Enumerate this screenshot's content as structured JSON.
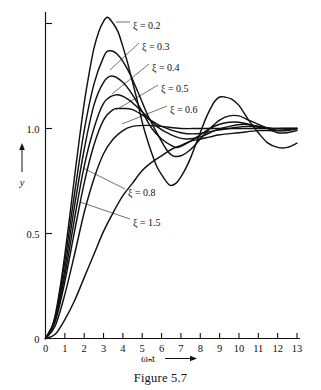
{
  "figure": {
    "caption": "Figure 5.7"
  },
  "chart_data": {
    "type": "line",
    "title": "",
    "subtitle": "",
    "xlabel": "ωₙt",
    "ylabel": "y",
    "xlim": [
      0,
      13
    ],
    "ylim": [
      0,
      1.6
    ],
    "grid": false,
    "legend_position": "inline-annotations",
    "x_ticks": [
      "0",
      "1",
      "2",
      "3",
      "4",
      "5",
      "6",
      "7",
      "8",
      "9",
      "10",
      "11",
      "12",
      "13"
    ],
    "x_tick_values": [
      0,
      1,
      2,
      3,
      4,
      5,
      6,
      7,
      8,
      9,
      10,
      11,
      12,
      13
    ],
    "y_ticks": [
      "0",
      "0.5",
      "1.0",
      ""
    ],
    "y_tick_values": [
      0,
      0.5,
      1.0,
      1.5
    ],
    "series": [
      {
        "name": "ξ = 0.2",
        "label": "ξ = 0.2",
        "zeta": 0.2,
        "peak_value": 1.53,
        "peak_time": 3.21,
        "trough_value": 0.73,
        "trough_time": 6.42,
        "second_peak_value": 1.14,
        "second_peak_time": 9.62,
        "x": [
          0,
          0.25,
          0.5,
          0.75,
          1,
          1.25,
          1.5,
          1.75,
          2,
          2.25,
          2.5,
          2.75,
          3,
          3.21,
          3.5,
          3.75,
          4,
          4.25,
          4.5,
          4.75,
          5,
          5.25,
          5.5,
          5.75,
          6,
          6.42,
          6.75,
          7,
          7.25,
          7.5,
          7.75,
          8,
          8.25,
          8.5,
          8.75,
          9,
          9.25,
          9.62,
          10,
          10.5,
          11,
          11.5,
          12,
          12.5,
          13
        ],
        "y": [
          0,
          0.03,
          0.11,
          0.24,
          0.4,
          0.58,
          0.77,
          0.95,
          1.12,
          1.26,
          1.38,
          1.46,
          1.51,
          1.53,
          1.5,
          1.46,
          1.39,
          1.31,
          1.22,
          1.13,
          1.03,
          0.95,
          0.88,
          0.82,
          0.78,
          0.73,
          0.74,
          0.77,
          0.81,
          0.86,
          0.92,
          0.98,
          1.04,
          1.09,
          1.13,
          1.15,
          1.15,
          1.14,
          1.11,
          1.04,
          0.98,
          0.93,
          0.91,
          0.91,
          0.93
        ]
      },
      {
        "name": "ξ = 0.3",
        "label": "ξ = 0.3",
        "zeta": 0.3,
        "peak_value": 1.37,
        "peak_time": 3.29,
        "trough_value": 0.85,
        "trough_time": 6.59,
        "x": [
          0,
          0.5,
          1,
          1.5,
          2,
          2.5,
          3,
          3.29,
          3.75,
          4.25,
          4.75,
          5.25,
          5.75,
          6.25,
          6.59,
          7,
          7.5,
          8,
          8.5,
          9,
          9.5,
          10,
          10.5,
          11,
          11.5,
          12,
          12.5,
          13
        ],
        "y": [
          0,
          0.1,
          0.37,
          0.69,
          0.99,
          1.21,
          1.34,
          1.37,
          1.35,
          1.28,
          1.18,
          1.07,
          0.98,
          0.9,
          0.87,
          0.87,
          0.9,
          0.95,
          1.0,
          1.04,
          1.06,
          1.06,
          1.04,
          1.02,
          1.0,
          0.98,
          0.98,
          0.99
        ]
      },
      {
        "name": "ξ = 0.4",
        "label": "ξ = 0.4",
        "zeta": 0.4,
        "peak_value": 1.25,
        "peak_time": 3.43,
        "trough_value": 0.92,
        "trough_time": 6.86,
        "x": [
          0,
          0.5,
          1,
          1.5,
          2,
          2.5,
          3,
          3.43,
          4,
          4.5,
          5,
          5.5,
          6,
          6.5,
          6.86,
          7.5,
          8,
          8.5,
          9,
          9.5,
          10,
          10.5,
          11,
          11.5,
          12,
          12.5,
          13
        ],
        "y": [
          0,
          0.09,
          0.33,
          0.63,
          0.9,
          1.11,
          1.22,
          1.25,
          1.22,
          1.16,
          1.08,
          1.0,
          0.95,
          0.92,
          0.91,
          0.94,
          0.97,
          1.0,
          1.02,
          1.03,
          1.03,
          1.02,
          1.01,
          1.0,
          0.99,
          0.99,
          1.0
        ]
      },
      {
        "name": "ξ = 0.5",
        "label": "ξ = 0.5",
        "zeta": 0.5,
        "peak_value": 1.16,
        "peak_time": 3.63,
        "trough_value": 0.95,
        "trough_time": 7.26,
        "x": [
          0,
          0.5,
          1,
          1.5,
          2,
          2.5,
          3,
          3.63,
          4.25,
          5,
          5.75,
          6.5,
          7.26,
          8,
          8.75,
          9.5,
          10.25,
          11,
          11.75,
          12.5,
          13
        ],
        "y": [
          0,
          0.09,
          0.3,
          0.57,
          0.82,
          1.0,
          1.12,
          1.16,
          1.14,
          1.08,
          1.01,
          0.97,
          0.95,
          0.96,
          0.99,
          1.01,
          1.02,
          1.01,
          1.0,
          1.0,
          1.0
        ]
      },
      {
        "name": "ξ = 0.6",
        "label": "ξ = 0.6",
        "zeta": 0.6,
        "peak_value": 1.095,
        "peak_time": 3.93,
        "trough_value": 0.975,
        "trough_time": 7.85,
        "x": [
          0,
          0.5,
          1,
          1.5,
          2,
          2.5,
          3,
          3.5,
          3.93,
          4.5,
          5.25,
          6,
          7,
          7.85,
          8.75,
          9.5,
          10.5,
          11.5,
          12.25,
          13
        ],
        "y": [
          0,
          0.08,
          0.27,
          0.51,
          0.74,
          0.92,
          1.04,
          1.09,
          1.095,
          1.09,
          1.05,
          1.01,
          0.98,
          0.975,
          0.99,
          1.0,
          1.01,
          1.0,
          1.0,
          1.0
        ]
      },
      {
        "name": "ξ = 0.8",
        "label": "ξ = 0.8",
        "zeta": 0.8,
        "peak_value": 1.015,
        "peak_time": 5.24,
        "x": [
          0,
          0.5,
          1,
          1.5,
          2,
          2.5,
          3,
          3.5,
          4,
          4.5,
          5.24,
          6,
          7,
          8,
          9,
          10,
          11,
          12,
          13
        ],
        "y": [
          0,
          0.06,
          0.21,
          0.4,
          0.6,
          0.76,
          0.88,
          0.95,
          0.99,
          1.01,
          1.015,
          1.01,
          1.0,
          1.0,
          1.0,
          1.0,
          1.0,
          1.0,
          1.0
        ]
      },
      {
        "name": "ξ = 1.5",
        "label": "ξ = 1.5",
        "zeta": 1.5,
        "peak_value": 1.0,
        "x": [
          0,
          0.5,
          1,
          1.5,
          2,
          2.5,
          3,
          3.5,
          4,
          4.5,
          5,
          5.5,
          6,
          6.5,
          7,
          7.5,
          8,
          8.5,
          9,
          10,
          11,
          12,
          13
        ],
        "y": [
          0,
          0.02,
          0.09,
          0.18,
          0.29,
          0.4,
          0.51,
          0.6,
          0.68,
          0.74,
          0.8,
          0.84,
          0.87,
          0.9,
          0.92,
          0.94,
          0.95,
          0.96,
          0.97,
          0.98,
          0.99,
          0.99,
          1.0
        ]
      }
    ],
    "annotations": [
      {
        "text": "ξ = 0.2",
        "x_px": 133,
        "y_px": 25
      },
      {
        "text": "ξ = 0.3",
        "x_px": 142,
        "y_px": 46
      },
      {
        "text": "ξ = 0.4",
        "x_px": 152,
        "y_px": 67
      },
      {
        "text": "ξ = 0.5",
        "x_px": 161,
        "y_px": 88
      },
      {
        "text": "ξ = 0.6",
        "x_px": 170,
        "y_px": 109
      },
      {
        "text": "ξ = 0.8",
        "x_px": 128,
        "y_px": 192
      },
      {
        "text": "ξ = 1.5",
        "x_px": 133,
        "y_px": 222
      }
    ]
  }
}
